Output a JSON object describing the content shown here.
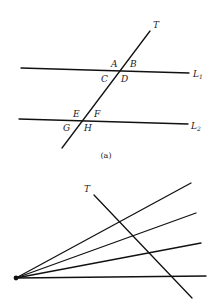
{
  "figure_a": {
    "caption": "(a)",
    "transversal_label": "T",
    "line1_label": "L",
    "line1_sub": "1",
    "line2_label": "L",
    "line2_sub": "2",
    "angles_line1": [
      "A",
      "B",
      "C",
      "D"
    ],
    "angles_line2": [
      "E",
      "F",
      "G",
      "H"
    ]
  },
  "figure_b": {
    "transversal_label": "T",
    "ray_count": 4
  },
  "colors": {
    "ink": "#111111",
    "background": "#ffffff"
  }
}
